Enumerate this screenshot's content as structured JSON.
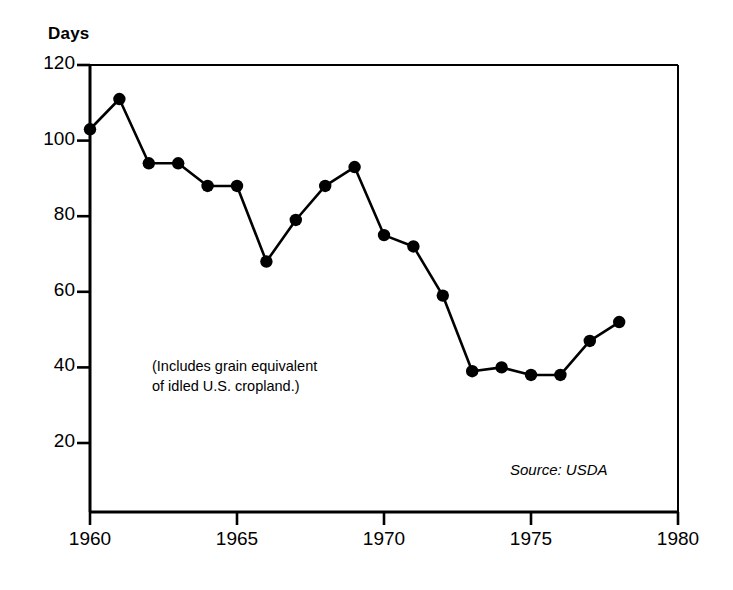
{
  "chart_data": {
    "type": "line",
    "title": "",
    "ylabel": "Days",
    "xlabel": "",
    "x": [
      1960,
      1961,
      1962,
      1963,
      1964,
      1965,
      1966,
      1967,
      1968,
      1969,
      1970,
      1971,
      1972,
      1973,
      1974,
      1975,
      1976,
      1977,
      1978
    ],
    "values": [
      103,
      111,
      94,
      94,
      88,
      88,
      68,
      79,
      88,
      93,
      75,
      72,
      59,
      39,
      40,
      38,
      38,
      47,
      52
    ],
    "series": [
      {
        "name": "Days",
        "values": [
          103,
          111,
          94,
          94,
          88,
          88,
          68,
          79,
          88,
          93,
          75,
          72,
          59,
          39,
          40,
          38,
          38,
          47,
          52
        ]
      }
    ],
    "ylim": [
      0,
      120
    ],
    "xlim": [
      1960,
      1980
    ],
    "yticks": [
      20,
      40,
      60,
      80,
      100,
      120
    ],
    "ytick_labels": [
      "20",
      "40",
      "60",
      "80",
      "100",
      "120"
    ],
    "xticks": [
      1960,
      1965,
      1970,
      1975,
      1980
    ],
    "xtick_labels": [
      "1960",
      "1965",
      "1970",
      "1975",
      "1980"
    ],
    "grid": false,
    "legend": "none",
    "marker": "filled-circle",
    "line_color": "#000000",
    "marker_color": "#000000",
    "background_color": "#ffffff",
    "annotations": [
      {
        "name": "includes-note",
        "text": "(Includes grain equivalent\nof idled U.S. cropland.)"
      },
      {
        "name": "source-note",
        "text": "Source: USDA"
      }
    ]
  },
  "labels": {
    "y_axis_title": "Days",
    "annotation_note": "(Includes grain equivalent\nof idled U.S. cropland.)",
    "source": "Source: USDA"
  }
}
